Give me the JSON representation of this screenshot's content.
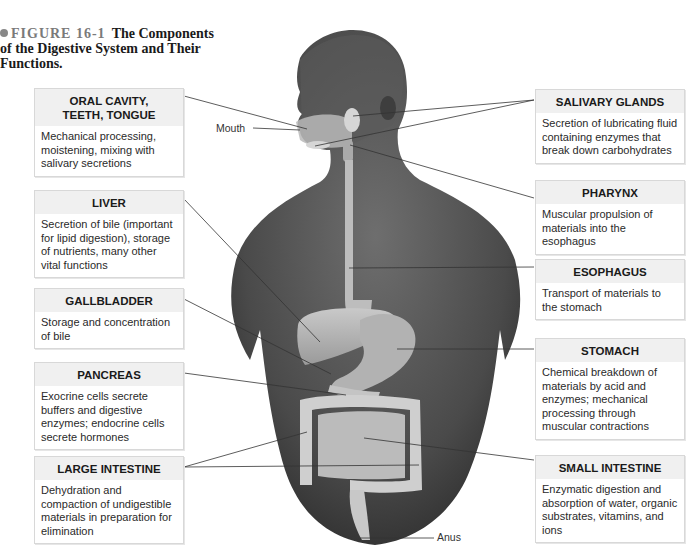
{
  "caption": {
    "figure_number": "FIGURE 16-1",
    "title_line1": "The Components",
    "title_line2": "of the Digestive System and Their Functions."
  },
  "illustration": {
    "description": "Human torso with digestive organs overlaid",
    "point_labels": {
      "mouth": "Mouth",
      "anus": "Anus"
    }
  },
  "left_boxes": [
    {
      "title_line1": "ORAL CAVITY,",
      "title_line2": "TEETH, TONGUE",
      "text": "Mechanical processing, moistening, mixing with salivary secretions"
    },
    {
      "title": "LIVER",
      "text": "Secretion of bile (important for lipid digestion), storage of nutrients, many other vital functions"
    },
    {
      "title": "GALLBLADDER",
      "text": "Storage and concentration of bile"
    },
    {
      "title": "PANCREAS",
      "text": "Exocrine cells secrete buffers and digestive enzymes; endocrine cells secrete hormones"
    },
    {
      "title": "LARGE INTESTINE",
      "text": "Dehydration and compaction of undigestible materials in preparation for elimination"
    }
  ],
  "right_boxes": [
    {
      "title": "SALIVARY GLANDS",
      "text": "Secretion of lubricating fluid containing enzymes that break down carbohydrates"
    },
    {
      "title": "PHARYNX",
      "text": "Muscular propulsion of materials into the esophagus"
    },
    {
      "title": "ESOPHAGUS",
      "text": "Transport of materials to the stomach"
    },
    {
      "title": "STOMACH",
      "text": "Chemical breakdown of materials by acid and enzymes; mechanical processing through muscular contractions"
    },
    {
      "title": "SMALL INTESTINE",
      "text": "Enzymatic digestion and absorption of water, organic substrates, vitamins, and ions"
    }
  ]
}
